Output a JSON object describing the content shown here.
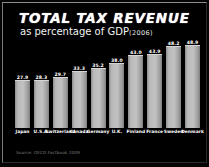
{
  "slide": {
    "title": "TOTAL TAX REVENUE",
    "subtitle": "as percentage of GDP",
    "year_note": "(2006)",
    "source": "Source: OECD Factbook 2009",
    "background_color": "#000000",
    "text_color": "#ffffff",
    "bar_color": "#b9b9b9",
    "source_color": "#7c7c7c"
  },
  "chart_data": {
    "type": "bar",
    "title": "TOTAL TAX REVENUE",
    "subtitle": "as percentage of GDP",
    "annotations": [
      "(2006)",
      "Source: OECD Factbook 2009"
    ],
    "xlabel": "",
    "ylabel": "",
    "ylim": [
      0,
      55
    ],
    "grid": false,
    "legend": "none",
    "categories": [
      "Japan",
      "U.S.A.",
      "Switzerland",
      "Canada",
      "Germany",
      "U.K.",
      "Finland",
      "France",
      "Sweden",
      "Denmark"
    ],
    "values": [
      27.9,
      28.3,
      29.7,
      33.3,
      35.2,
      38.0,
      43.0,
      43.9,
      48.2,
      48.9
    ],
    "value_labels": [
      "27.9",
      "28.3",
      "29.7",
      "33.3",
      "35.2",
      "38.0",
      "43.0",
      "43.9",
      "48.2",
      "48.9"
    ],
    "bars": [
      {
        "category": "Japan",
        "value": 27.9,
        "label": "27.9"
      },
      {
        "category": "U.S.A.",
        "value": 28.3,
        "label": "28.3"
      },
      {
        "category": "Switzerland",
        "value": 29.7,
        "label": "29.7"
      },
      {
        "category": "Canada",
        "value": 33.3,
        "label": "33.3"
      },
      {
        "category": "Germany",
        "value": 35.2,
        "label": "35.2"
      },
      {
        "category": "U.K.",
        "value": 38.0,
        "label": "38.0"
      },
      {
        "category": "Finland",
        "value": 43.0,
        "label": "43.0"
      },
      {
        "category": "France",
        "value": 43.9,
        "label": "43.9"
      },
      {
        "category": "Sweden",
        "value": 48.2,
        "label": "48.2"
      },
      {
        "category": "Denmark",
        "value": 48.9,
        "label": "48.9"
      }
    ]
  }
}
